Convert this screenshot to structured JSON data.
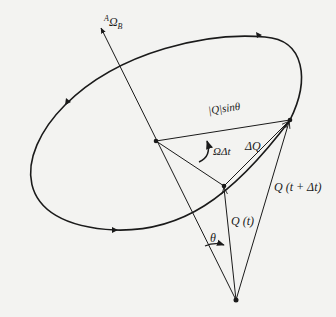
{
  "diagram": {
    "type": "vector-precession",
    "colors": {
      "ink": "#1a1a1a",
      "background": "#f3f3f1"
    },
    "labels": {
      "omega_b": {
        "pre": "A",
        "main": "Ω",
        "sub": "B"
      },
      "q_sin_theta": "|Q|sinθ",
      "omega_delta_t": "ΩΔt",
      "delta_q": "ΔQ",
      "q_t_plus_dt": "Q (t + Δt)",
      "q_t": "Q (t)",
      "theta": "θ"
    },
    "points": {
      "origin": [
        236,
        300
      ],
      "axis_tip": [
        100,
        27
      ],
      "center": [
        156,
        141
      ],
      "q_t_tip": [
        224,
        186
      ],
      "q_t_dt_tip": [
        290,
        120
      ]
    }
  }
}
